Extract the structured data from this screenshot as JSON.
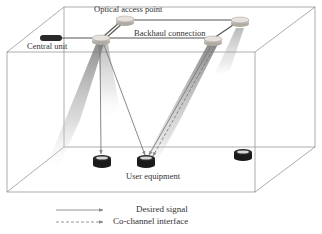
{
  "diagram": {
    "labels": {
      "optical_access_point": "Optical access point",
      "central_unit": "Central unit",
      "backhaul_connection": "Backhaul connection",
      "user_equipment": "User equipment"
    },
    "legend": [
      {
        "label": "Desired signal",
        "style": "solid-arrow"
      },
      {
        "label": "Co-channel interface",
        "style": "dashed-arrow"
      }
    ],
    "nodes": {
      "central_unit": {
        "shape": "dark-pill"
      },
      "access_points": 3,
      "user_equipment": 3
    },
    "colors": {
      "line": "#555555",
      "box_edge": "#8a8a8a",
      "beam": "#9a9a9a",
      "ue": "#1a1a1a",
      "ap": "#cfc8c0"
    }
  }
}
